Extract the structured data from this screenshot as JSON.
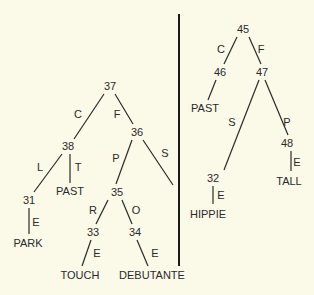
{
  "colors": {
    "background": "#fbf9e8",
    "ink": "#2a2a2a"
  },
  "left_tree": {
    "nodes": [
      {
        "id": "37",
        "x": 110,
        "y": 90
      },
      {
        "id": "38",
        "x": 68,
        "y": 150
      },
      {
        "id": "36",
        "x": 137,
        "y": 136
      },
      {
        "id": "31",
        "x": 29,
        "y": 204
      },
      {
        "id": "PAST",
        "x": 70,
        "y": 195
      },
      {
        "id": "35",
        "x": 117,
        "y": 196
      },
      {
        "id": "PARK",
        "x": 28,
        "y": 247
      },
      {
        "id": "33",
        "x": 93,
        "y": 236
      },
      {
        "id": "34",
        "x": 135,
        "y": 236
      },
      {
        "id": "TOUCH",
        "x": 80,
        "y": 279
      },
      {
        "id": "DEBUTANTE",
        "x": 152,
        "y": 279
      }
    ],
    "edges": [
      {
        "from": "37",
        "to": "38",
        "label": "C",
        "x1": 104,
        "y1": 94,
        "x2": 74,
        "y2": 139,
        "lx": 78,
        "ly": 118
      },
      {
        "from": "37",
        "to": "36",
        "label": "F",
        "x1": 115,
        "y1": 94,
        "x2": 133,
        "y2": 124,
        "lx": 117,
        "ly": 118
      },
      {
        "from": "38",
        "to": "31",
        "label": "L",
        "x1": 62,
        "y1": 154,
        "x2": 34,
        "y2": 192,
        "lx": 40,
        "ly": 171
      },
      {
        "from": "38",
        "to": "PAST",
        "label": "T",
        "x1": 70,
        "y1": 154,
        "x2": 70,
        "y2": 183,
        "lx": 78,
        "ly": 171
      },
      {
        "from": "36",
        "to": "35",
        "label": "P",
        "x1": 132,
        "y1": 140,
        "x2": 116,
        "y2": 184,
        "lx": 116,
        "ly": 162
      },
      {
        "from": "36",
        "to": "leaf",
        "label": "S",
        "x1": 143,
        "y1": 140,
        "x2": 173,
        "y2": 185,
        "lx": 165,
        "ly": 157
      },
      {
        "from": "31",
        "to": "PARK",
        "label": "E",
        "x1": 29,
        "y1": 208,
        "x2": 29,
        "y2": 234,
        "lx": 36,
        "ly": 226
      },
      {
        "from": "35",
        "to": "33",
        "label": "R",
        "x1": 108,
        "y1": 200,
        "x2": 96,
        "y2": 224,
        "lx": 93,
        "ly": 214
      },
      {
        "from": "35",
        "to": "34",
        "label": "O",
        "x1": 122,
        "y1": 200,
        "x2": 132,
        "y2": 224,
        "lx": 136,
        "ly": 214
      },
      {
        "from": "33",
        "to": "TOUCH",
        "label": "E",
        "x1": 91,
        "y1": 240,
        "x2": 82,
        "y2": 266,
        "lx": 97,
        "ly": 257
      },
      {
        "from": "34",
        "to": "DEBUTANTE",
        "label": "E",
        "x1": 137,
        "y1": 240,
        "x2": 148,
        "y2": 266,
        "lx": 155,
        "ly": 257
      }
    ]
  },
  "right_tree": {
    "nodes": [
      {
        "id": "45",
        "x": 243,
        "y": 33
      },
      {
        "id": "46",
        "x": 220,
        "y": 76
      },
      {
        "id": "47",
        "x": 262,
        "y": 76
      },
      {
        "id": "PAST",
        "x": 205,
        "y": 112
      },
      {
        "id": "32",
        "x": 213,
        "y": 182
      },
      {
        "id": "48",
        "x": 287,
        "y": 147
      },
      {
        "id": "HIPPIE",
        "x": 208,
        "y": 218
      },
      {
        "id": "TALL",
        "x": 289,
        "y": 185
      }
    ],
    "edges": [
      {
        "from": "45",
        "to": "46",
        "label": "C",
        "x1": 237,
        "y1": 37,
        "x2": 224,
        "y2": 64,
        "lx": 221,
        "ly": 53
      },
      {
        "from": "45",
        "to": "47",
        "label": "F",
        "x1": 249,
        "y1": 37,
        "x2": 261,
        "y2": 64,
        "lx": 261,
        "ly": 53
      },
      {
        "from": "46",
        "to": "PAST",
        "label": "",
        "x1": 216,
        "y1": 80,
        "x2": 208,
        "y2": 100,
        "lx": 0,
        "ly": 0
      },
      {
        "from": "47",
        "to": "32",
        "label": "S",
        "x1": 259,
        "y1": 80,
        "x2": 224,
        "y2": 170,
        "lx": 232,
        "ly": 126
      },
      {
        "from": "47",
        "to": "48",
        "label": "P",
        "x1": 265,
        "y1": 80,
        "x2": 288,
        "y2": 135,
        "lx": 287,
        "ly": 126
      },
      {
        "from": "32",
        "to": "HIPPIE",
        "label": "E",
        "x1": 213,
        "y1": 186,
        "x2": 213,
        "y2": 204,
        "lx": 221,
        "ly": 199
      },
      {
        "from": "48",
        "to": "TALL",
        "label": "E",
        "x1": 291,
        "y1": 151,
        "x2": 291,
        "y2": 171,
        "lx": 297,
        "ly": 166
      }
    ]
  },
  "divider": {
    "x": 179,
    "y1": 14,
    "y2": 266
  }
}
